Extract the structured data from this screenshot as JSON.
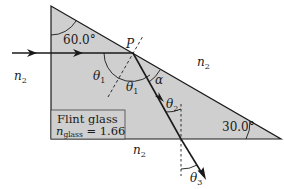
{
  "figure": {
    "colors": {
      "prism_fill": "#cfcfcf",
      "stroke": "#1a1a1a",
      "background": "#ffffff"
    },
    "labels": {
      "point": "P",
      "angle_top": "60.0°",
      "angle_bottom_right": "30.0°",
      "theta1_a": "θ",
      "theta1_a_sub": "1",
      "theta1_b": "θ",
      "theta1_b_sub": "1",
      "alpha": "α",
      "theta2": "θ",
      "theta2_sub": "2",
      "theta3": "θ",
      "theta3_sub": "3",
      "medium_left": "n",
      "medium_left_sub": "2",
      "medium_right": "n",
      "medium_right_sub": "2",
      "medium_bottom": "n",
      "medium_bottom_sub": "2",
      "material_name": "Flint glass",
      "index_symbol": "n",
      "index_sub": "glass",
      "index_value": " = 1.66"
    }
  }
}
